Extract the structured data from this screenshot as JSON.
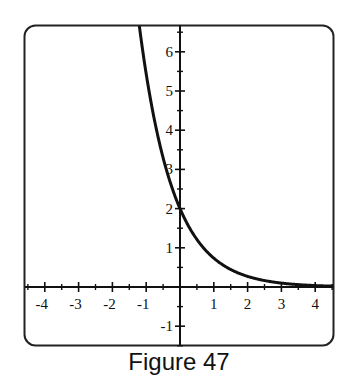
{
  "caption": "Figure 47",
  "chart_data": {
    "type": "line",
    "title": "",
    "caption": "Figure 47",
    "xlabel": "",
    "ylabel": "",
    "xlim": [
      -4.5,
      4.5
    ],
    "ylim": [
      -1.5,
      6.7
    ],
    "grid": false,
    "legend": null,
    "x_ticks": [
      -4,
      -3,
      -2,
      -1,
      1,
      2,
      3,
      4
    ],
    "x_tick_labels": [
      "-4",
      "-3",
      "-2",
      "-1",
      "1",
      "2",
      "3",
      "4"
    ],
    "y_ticks": [
      -1,
      1,
      2,
      3,
      4,
      5,
      6
    ],
    "y_tick_labels": [
      "-1",
      "1",
      "2",
      "3",
      "4",
      "5",
      "6"
    ],
    "minor_ticks_step": 0.5,
    "series": [
      {
        "name": "y = 2e^(-x)",
        "x": [
          -1.1,
          -1.0,
          -0.75,
          -0.5,
          -0.25,
          0,
          0.25,
          0.5,
          0.75,
          1.0,
          1.5,
          2.0,
          2.5,
          3.0,
          3.5,
          4.0,
          4.5
        ],
        "y": [
          6.01,
          5.44,
          4.23,
          3.3,
          2.57,
          2.0,
          1.56,
          1.21,
          0.94,
          0.74,
          0.45,
          0.27,
          0.16,
          0.1,
          0.06,
          0.04,
          0.02
        ]
      }
    ],
    "annotations": [
      "y-intercept at (0, 2)",
      "horizontal asymptote y = 0"
    ]
  },
  "colors": {
    "line": "#111111",
    "axis": "#111111",
    "frame": "#222222",
    "background": "#ffffff"
  }
}
